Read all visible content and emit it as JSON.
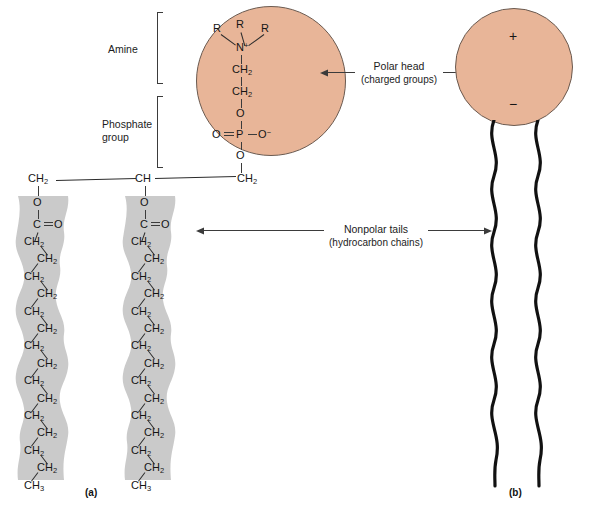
{
  "figure": {
    "panel_a_id": "(a)",
    "panel_b_id": "(b)"
  },
  "left_labels": {
    "amine": "Amine",
    "phosphate_line1": "Phosphate",
    "phosphate_line2": "group"
  },
  "annotations": {
    "polar_head_line1": "Polar head",
    "polar_head_line2": "(charged groups)",
    "nonpolar_line1": "Nonpolar tails",
    "nonpolar_line2": "(hydrocarbon chains)"
  },
  "head_group": {
    "r_left": "R",
    "r_middle": "R",
    "r_right": "R",
    "nitrogen": "N",
    "nitrogen_charge": "+",
    "ch2_upper": "CH",
    "ch2_upper_sub": "2",
    "ch2_lower": "CH",
    "ch2_lower_sub": "2",
    "o_ester_top": "O",
    "phosphate_o_double": "O",
    "phosphate_p": "P",
    "phosphate_o_minus": "O",
    "phosphate_o_minus_charge": "−",
    "o_ester_bottom": "O"
  },
  "glycerol": {
    "c1": "CH",
    "c1_sub": "2",
    "c2": "CH",
    "c3": "CH",
    "c3_sub": "2"
  },
  "ester_left": {
    "o": "O",
    "c": "C",
    "o_double": "O"
  },
  "ester_right": {
    "o": "O",
    "c": "C",
    "o_double": "O"
  },
  "chain_left": {
    "units": [
      "CH2",
      "CH2",
      "CH2",
      "CH2",
      "CH2",
      "CH2",
      "CH2",
      "CH2",
      "CH2",
      "CH2",
      "CH2",
      "CH2",
      "CH2",
      "CH2"
    ],
    "terminal": "CH3",
    "ch2_text": "CH",
    "ch2_sub": "2",
    "ch3_text": "CH",
    "ch3_sub": "3"
  },
  "chain_right": {
    "units": [
      "CH2",
      "CH2",
      "CH2",
      "CH2",
      "CH2",
      "CH2",
      "CH2",
      "CH2",
      "CH2",
      "CH2",
      "CH2",
      "CH2",
      "CH2",
      "CH2"
    ],
    "terminal": "CH3",
    "ch2_text": "CH",
    "ch2_sub": "2",
    "ch3_text": "CH",
    "ch3_sub": "3"
  },
  "schematic_b": {
    "plus_sign": "+",
    "minus_sign": "−"
  },
  "colors": {
    "head_fill": "#e8b598",
    "head_stroke": "#6a5a50",
    "tail_band": "#c8c8c8",
    "line": "#3b3b3b",
    "text": "#1a1a1a"
  }
}
